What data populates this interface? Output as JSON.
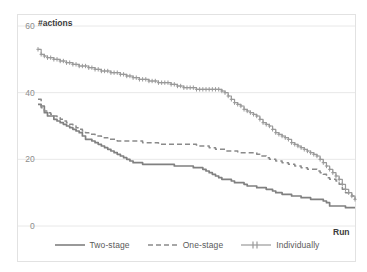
{
  "chart_data": {
    "type": "line",
    "title": "",
    "xlabel": "Run",
    "ylabel": "#actions",
    "ylim": [
      0,
      60
    ],
    "yticks": [
      0,
      20,
      40,
      60
    ],
    "ytick_labels": [
      "0",
      "20",
      "40",
      "60"
    ],
    "xlim": [
      0,
      100
    ],
    "xticks": [],
    "xtick_labels": [],
    "grid": "horizontal",
    "legend_position": "bottom-center",
    "colors": {
      "two_stage": "#808080",
      "one_stage": "#8a8a8a",
      "individually": "#9a9a9a",
      "gridline": "#e8e8e8",
      "text": "#7f7f7f",
      "axis_title": "#404040"
    },
    "series": [
      {
        "name": "Two-stage",
        "style": "solid",
        "marker": "none",
        "values": [
          36.5,
          36,
          34,
          33,
          33,
          32,
          31.5,
          31,
          30.5,
          30,
          29.5,
          29,
          28.5,
          28,
          27,
          26,
          26,
          25.5,
          25,
          24.5,
          24,
          23.5,
          23,
          22.5,
          22,
          21.5,
          21,
          20.5,
          20,
          19.5,
          19,
          19,
          19,
          18.5,
          18.5,
          18.5,
          18.5,
          18.5,
          18.5,
          18.5,
          18.5,
          18.5,
          18.5,
          18,
          18,
          18,
          18,
          18,
          18,
          17.5,
          17.5,
          17.5,
          17,
          16.5,
          16,
          15.5,
          15,
          14.5,
          14,
          14,
          14,
          13.5,
          13,
          13,
          13,
          12.5,
          12,
          12,
          12,
          11.5,
          11.5,
          11.5,
          11,
          11,
          10.5,
          10,
          10,
          9.5,
          9.5,
          9.5,
          9,
          9,
          9,
          8.5,
          8.5,
          8.5,
          8,
          8,
          8,
          8,
          7.5,
          7,
          6,
          6,
          6,
          6,
          6,
          5.5,
          5.5,
          5.5,
          5.5
        ]
      },
      {
        "name": "One-stage",
        "style": "dashed",
        "marker": "none",
        "values": [
          38,
          35.5,
          34.5,
          34,
          33.5,
          33,
          32.5,
          32,
          31.5,
          31,
          30.5,
          30,
          29.5,
          29,
          28.5,
          28,
          27.5,
          27.5,
          27,
          27,
          26.5,
          26.5,
          26,
          26,
          26,
          25.5,
          25.5,
          25.5,
          25.5,
          25.5,
          25.5,
          25.5,
          25.5,
          25,
          25,
          25,
          25,
          25,
          24.5,
          24.5,
          24.5,
          24.5,
          24.5,
          24.5,
          24.5,
          24.5,
          24.5,
          24.5,
          24.5,
          24.5,
          24,
          24,
          24,
          24,
          23.5,
          23.5,
          23,
          23,
          23,
          22.5,
          22.5,
          22.5,
          22.5,
          22,
          22,
          22,
          22,
          22,
          22,
          21.5,
          21,
          21,
          20.5,
          20,
          20,
          19.5,
          19.5,
          19,
          19,
          18.5,
          18.5,
          18,
          18,
          17.5,
          17.5,
          17,
          17,
          17,
          16.5,
          16,
          15.5,
          14.5,
          14,
          14,
          13.5,
          12.5,
          11,
          10,
          9.5,
          9,
          8
        ]
      },
      {
        "name": "Individually",
        "style": "solid",
        "marker": "plus",
        "values": [
          53,
          51.5,
          51,
          50.5,
          50.5,
          50,
          50,
          49.5,
          49.5,
          49,
          49,
          48.5,
          48.5,
          48,
          48,
          48,
          47.5,
          47.5,
          47,
          47,
          46.5,
          46.5,
          46.5,
          46,
          46,
          46,
          45.5,
          45.5,
          45,
          45,
          44.5,
          44.5,
          44,
          44,
          44,
          43.5,
          43.5,
          43.5,
          43,
          43,
          43,
          43,
          42.5,
          42.5,
          42,
          42,
          41.5,
          41.5,
          41.5,
          41.5,
          41,
          41,
          41,
          41,
          41,
          41,
          41,
          41,
          40.5,
          40,
          39,
          38,
          37,
          36.5,
          36,
          35,
          34.5,
          34,
          33.5,
          33,
          32,
          31,
          30.5,
          30,
          29,
          28,
          27.5,
          27,
          26.5,
          26,
          25,
          24.5,
          24,
          23.5,
          23,
          22.5,
          22,
          21.5,
          21,
          20,
          19,
          18,
          17,
          16,
          15,
          14,
          12.5,
          11,
          10,
          9,
          8
        ]
      }
    ]
  },
  "legend": {
    "items": [
      {
        "label": "Two-stage"
      },
      {
        "label": "One-stage"
      },
      {
        "label": "Individually"
      }
    ]
  }
}
